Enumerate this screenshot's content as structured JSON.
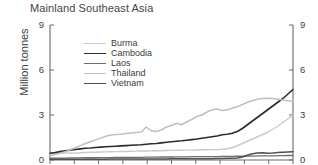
{
  "chart_data": {
    "type": "line",
    "title": "Mainland Southeast Asia",
    "xlabel": "",
    "ylabel": "Million tonnes",
    "ylim": [
      0,
      9
    ],
    "yticks": [
      0,
      3,
      6,
      9
    ],
    "ytick_labels": [
      "0",
      "3",
      "6",
      "9"
    ],
    "right_axis": true,
    "right_yticks": [
      0,
      3,
      6,
      9
    ],
    "right_ytick_labels": [
      "0",
      "3",
      "6",
      "9"
    ],
    "grid": false,
    "legend_position": "upper-left-inside",
    "x_tick_count": 10,
    "x_tick_labels": [],
    "x": [
      0,
      1,
      2,
      3,
      4,
      5,
      6,
      7,
      8,
      9,
      10,
      11,
      12,
      13,
      14,
      15,
      16,
      17,
      18,
      19,
      20,
      21,
      22,
      23,
      24,
      25,
      26,
      27,
      28,
      29,
      30,
      31,
      32,
      33,
      34,
      35,
      36,
      37,
      38,
      39,
      40,
      41,
      42,
      43,
      44,
      45,
      46,
      47,
      48
    ],
    "series": [
      {
        "name": "Burma",
        "color": "#c9c9c9",
        "width": 1.4,
        "values": [
          0.42,
          0.44,
          0.45,
          0.46,
          0.47,
          0.46,
          0.48,
          0.5,
          0.52,
          0.52,
          0.53,
          0.54,
          0.55,
          0.56,
          0.57,
          0.57,
          0.58,
          0.59,
          0.6,
          0.6,
          0.61,
          0.62,
          0.62,
          0.63,
          0.64,
          0.64,
          0.65,
          0.66,
          0.66,
          0.67,
          0.68,
          0.68,
          0.69,
          0.7,
          0.72,
          0.75,
          0.82,
          0.95,
          1.1,
          1.25,
          1.4,
          1.55,
          1.7,
          1.85,
          2.05,
          2.25,
          2.5,
          2.75,
          3.0
        ]
      },
      {
        "name": "Cambodia",
        "color": "#2b2b2b",
        "width": 1.6,
        "values": [
          0.45,
          0.5,
          0.56,
          0.62,
          0.66,
          0.7,
          0.74,
          0.78,
          0.8,
          0.83,
          0.86,
          0.88,
          0.9,
          0.92,
          0.94,
          0.96,
          0.98,
          1.0,
          1.02,
          1.05,
          1.08,
          1.1,
          1.14,
          1.18,
          1.22,
          1.25,
          1.28,
          1.32,
          1.36,
          1.4,
          1.45,
          1.5,
          1.55,
          1.6,
          1.68,
          1.72,
          1.78,
          1.9,
          2.1,
          2.35,
          2.6,
          2.85,
          3.1,
          3.35,
          3.6,
          3.85,
          4.1,
          4.4,
          4.7
        ]
      },
      {
        "name": "Laos",
        "color": "#6e6e6e",
        "width": 1.3,
        "values": [
          0.12,
          0.12,
          0.13,
          0.13,
          0.14,
          0.14,
          0.14,
          0.15,
          0.15,
          0.15,
          0.16,
          0.16,
          0.16,
          0.17,
          0.17,
          0.17,
          0.18,
          0.18,
          0.18,
          0.19,
          0.19,
          0.19,
          0.2,
          0.2,
          0.2,
          0.21,
          0.21,
          0.21,
          0.22,
          0.22,
          0.22,
          0.23,
          0.23,
          0.23,
          0.24,
          0.24,
          0.24,
          0.25,
          0.25,
          0.26,
          0.26,
          0.27,
          0.27,
          0.28,
          0.28,
          0.29,
          0.29,
          0.3,
          0.3
        ]
      },
      {
        "name": "Thailand",
        "color": "#bfbfbf",
        "width": 1.5,
        "values": [
          0.3,
          0.36,
          0.45,
          0.55,
          0.68,
          0.82,
          0.96,
          1.1,
          1.22,
          1.34,
          1.46,
          1.58,
          1.66,
          1.7,
          1.72,
          1.76,
          1.8,
          1.84,
          1.86,
          2.2,
          1.95,
          1.9,
          2.0,
          2.2,
          2.3,
          2.45,
          2.35,
          2.55,
          2.7,
          2.9,
          3.0,
          3.2,
          3.35,
          3.4,
          3.3,
          3.35,
          3.45,
          3.55,
          3.7,
          3.85,
          3.95,
          4.05,
          4.1,
          4.12,
          4.1,
          4.05,
          4.0,
          3.95,
          3.9
        ]
      },
      {
        "name": "Vietnam",
        "color": "#4f4f4f",
        "width": 1.5,
        "values": [
          0.05,
          0.05,
          0.05,
          0.05,
          0.05,
          0.05,
          0.05,
          0.05,
          0.05,
          0.05,
          0.05,
          0.05,
          0.06,
          0.06,
          0.06,
          0.06,
          0.06,
          0.06,
          0.07,
          0.07,
          0.07,
          0.07,
          0.07,
          0.07,
          0.08,
          0.08,
          0.08,
          0.08,
          0.08,
          0.09,
          0.09,
          0.09,
          0.09,
          0.1,
          0.1,
          0.11,
          0.12,
          0.14,
          0.2,
          0.32,
          0.42,
          0.46,
          0.48,
          0.45,
          0.47,
          0.5,
          0.52,
          0.54,
          0.55
        ]
      }
    ]
  },
  "legend": {
    "items": [
      {
        "label": "Burma"
      },
      {
        "label": "Cambodia"
      },
      {
        "label": "Laos"
      },
      {
        "label": "Thailand"
      },
      {
        "label": "Vietnam"
      }
    ]
  }
}
